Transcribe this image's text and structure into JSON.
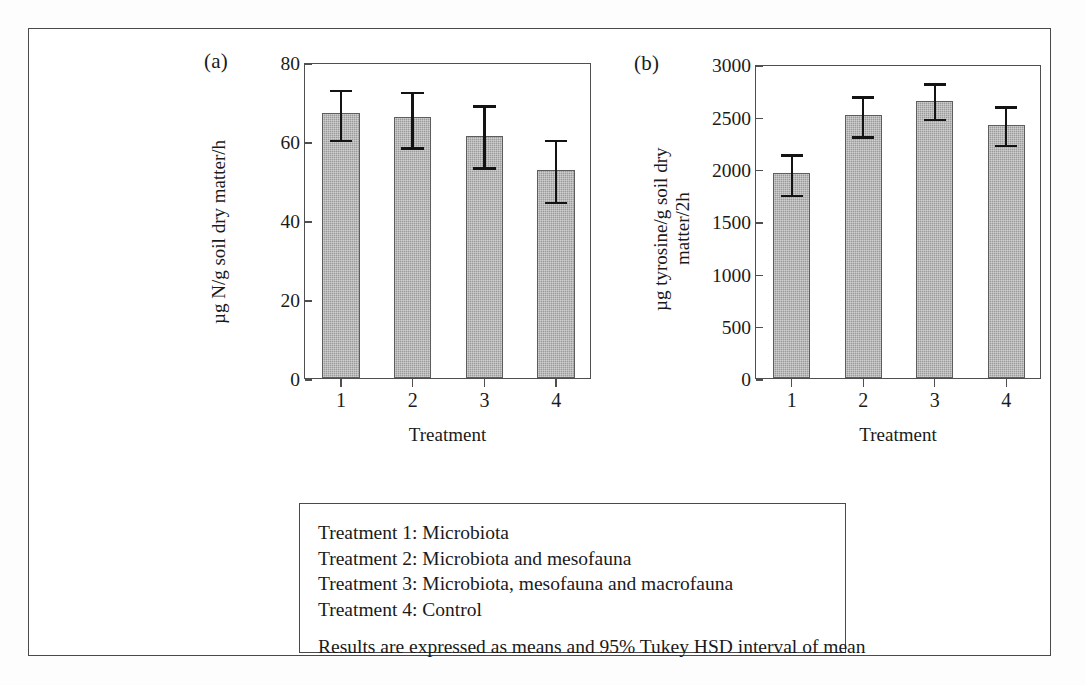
{
  "figure": {
    "panel_a_tag": "(a)",
    "panel_b_tag": "(b)"
  },
  "chart_data": [
    {
      "type": "bar",
      "panel": "(a)",
      "title": "",
      "xlabel": "Treatment",
      "ylabel": "µg N/g soil dry matter/h",
      "categories": [
        "1",
        "2",
        "3",
        "4"
      ],
      "values": [
        67,
        66,
        61.3,
        52.7
      ],
      "error_upper": [
        73.5,
        73,
        69.5,
        60.8
      ],
      "error_lower": [
        60.2,
        58.3,
        53.2,
        44.5
      ],
      "ylim": [
        0,
        80
      ],
      "yticks": [
        0,
        20,
        40,
        60,
        80
      ],
      "ytick_labels": [
        "0",
        "20",
        "40",
        "60",
        "80"
      ],
      "grid": false,
      "legend": "none",
      "bar_color": "#9b9b9b",
      "error_color": "#131313"
    },
    {
      "type": "bar",
      "panel": "(b)",
      "title": "",
      "xlabel": "Treatment",
      "ylabel": "µg tyrosine/g soil dry matter/2h",
      "ylabel_line1": "µg tyrosine/g soil dry",
      "ylabel_line2": "matter/2h",
      "categories": [
        "1",
        "2",
        "3",
        "4"
      ],
      "values": [
        1955,
        2510,
        2650,
        2415
      ],
      "error_upper": [
        2160,
        2710,
        2835,
        2615
      ],
      "error_lower": [
        1745,
        2305,
        2470,
        2225
      ],
      "ylim": [
        0,
        3000
      ],
      "yticks": [
        0,
        500,
        1000,
        1500,
        2000,
        2500,
        3000
      ],
      "ytick_labels": [
        "0",
        "500",
        "1000",
        "1500",
        "2000",
        "2500",
        "3000"
      ],
      "grid": false,
      "legend": "none",
      "bar_color": "#9b9b9b",
      "error_color": "#131313"
    }
  ],
  "legend_box": {
    "lines": [
      "Treatment 1: Microbiota",
      "Treatment 2: Microbiota and mesofauna",
      "Treatment 3: Microbiota, mesofauna and macrofauna",
      "Treatment 4: Control"
    ],
    "note": "Results are expressed as means and 95% Tukey HSD interval of mean"
  }
}
